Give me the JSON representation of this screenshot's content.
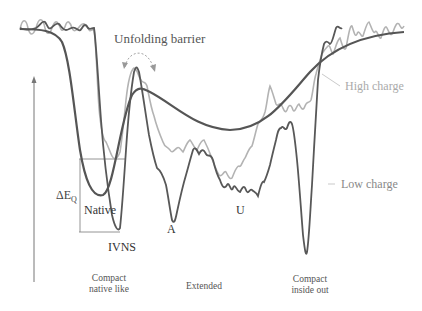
{
  "diagram": {
    "type": "energy-landscape",
    "annotations": {
      "barrier": "Unfolding barrier",
      "delta_e": "ΔE",
      "delta_e_sub": "Q",
      "native": "Native",
      "ivns": "IVNS",
      "a": "A",
      "u": "U"
    },
    "legend": {
      "high_charge": "High charge",
      "low_charge": "Low charge"
    },
    "x_regions": {
      "compact_native_1": "Compact",
      "compact_native_2": "native like",
      "extended": "Extended",
      "compact_inside_1": "Compact",
      "compact_inside_2": "inside out"
    },
    "colors": {
      "smooth": "#555555",
      "low_charge": "#5a5a5a",
      "high_charge": "#b0b0b0",
      "axis": "#777777"
    }
  }
}
